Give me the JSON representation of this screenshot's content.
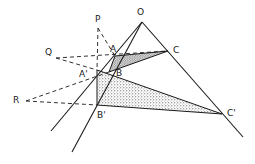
{
  "diagram": {
    "type": "geometry",
    "colors": {
      "ink": "#1a1a1a",
      "shade": "#9a9a9a",
      "background": "#ffffff"
    },
    "points": {
      "O": {
        "label": "O",
        "x": 142,
        "y": 22
      },
      "A": {
        "label": "A",
        "x": 115,
        "y": 56
      },
      "B": {
        "label": "B",
        "x": 109,
        "y": 72
      },
      "C": {
        "label": "C",
        "x": 168,
        "y": 51
      },
      "A_prime": {
        "label": "A'",
        "x": 97,
        "y": 70
      },
      "B_prime": {
        "label": "B'",
        "x": 97,
        "y": 105
      },
      "C_prime": {
        "label": "C'",
        "x": 222,
        "y": 114
      },
      "P": {
        "label": "P",
        "x": 98,
        "y": 27
      },
      "Q": {
        "label": "Q",
        "x": 56,
        "y": 58
      },
      "R": {
        "label": "R",
        "x": 26,
        "y": 101
      }
    },
    "labels": {
      "O": "O",
      "A": "A",
      "B": "B",
      "C": "C",
      "A_prime": "A'",
      "B_prime": "B'",
      "C_prime": "C'",
      "P": "P",
      "Q": "Q",
      "R": "R"
    },
    "triangles": [
      {
        "name": "ABC",
        "vertices": [
          "A",
          "B",
          "C"
        ],
        "shaded": true
      },
      {
        "name": "A'B'C'",
        "vertices": [
          "A_prime",
          "B_prime",
          "C_prime"
        ],
        "shaded": true
      }
    ],
    "lines": [
      {
        "from": "O",
        "through": [
          "A",
          "A_prime"
        ],
        "style": "solid"
      },
      {
        "from": "O",
        "through": [
          "B",
          "B_prime"
        ],
        "style": "solid"
      },
      {
        "from": "O",
        "through": [
          "C",
          "C_prime"
        ],
        "style": "solid"
      },
      {
        "from": "P",
        "to": "A_prime",
        "style": "dashed"
      },
      {
        "from": "Q",
        "to": "C",
        "style": "dashed"
      },
      {
        "from": "Q",
        "to": "A_prime",
        "style": "dashed"
      },
      {
        "from": "R",
        "to": "A_prime",
        "style": "dashed"
      },
      {
        "from": "R",
        "to": "B_prime",
        "style": "dashed"
      }
    ]
  }
}
